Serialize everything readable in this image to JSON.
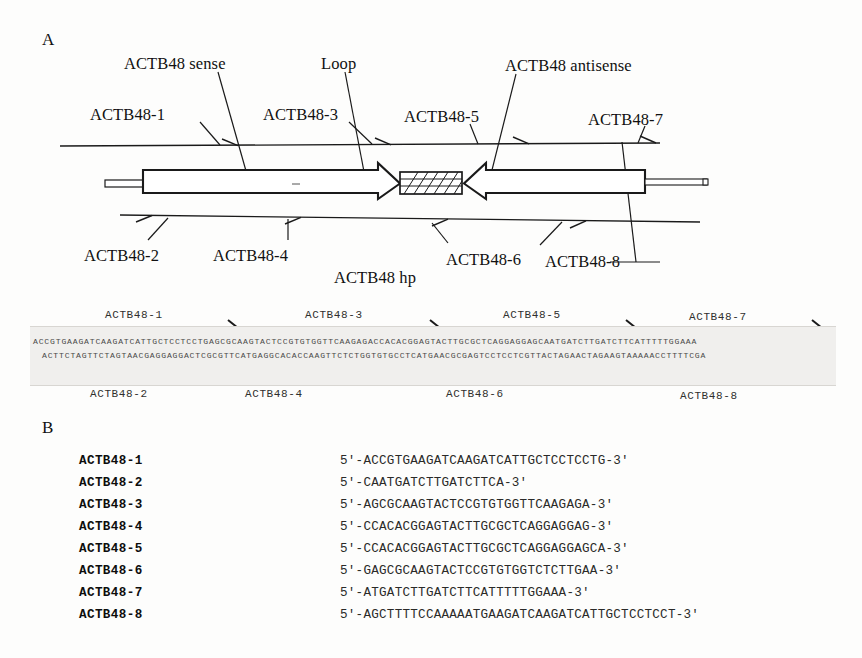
{
  "panels": {
    "a_letter": "A",
    "b_letter": "B"
  },
  "panel_a": {
    "annotations": {
      "sense": "ACTB48 sense",
      "loop": "Loop",
      "antisense": "ACTB48 antisense",
      "hairpin": "ACTB48 hp"
    },
    "top_primers": [
      {
        "label": "ACTB48-1"
      },
      {
        "label": "ACTB48-3"
      },
      {
        "label": "ACTB48-5"
      },
      {
        "label": "ACTB48-7"
      }
    ],
    "bottom_primers": [
      {
        "label": "ACTB48-2"
      },
      {
        "label": "ACTB48-4"
      },
      {
        "label": "ACTB48-6"
      },
      {
        "label": "ACTB48-8"
      }
    ]
  },
  "alignment": {
    "top_strand": "ACCGTGAAGATCAAGATCATTGCTCCTCCTGAGCGCAAGTACTCCGTGTGGTTCAAGAGACCACACGGAGTACTTGCGCTCAGGAGGAGCAATGATCTTGATCTTCATTTTTGGAAA",
    "bottom_strand": "ACTTCTAGTTCTAGTAACGAGGAGGACTCGCGTTCATGAGGCACACCAAGTTCTCTGGTGTGCCTCATGAACGCGAGTCCTCCTCGTTACTAGAACTAGAAGTAAAAACCTTTTCGA",
    "top_primer_labels": [
      "ACTB48-1",
      "ACTB48-3",
      "ACTB48-5",
      "ACTB48-7"
    ],
    "bottom_primer_labels": [
      "ACTB48-2",
      "ACTB48-4",
      "ACTB48-6",
      "ACTB48-8"
    ]
  },
  "panel_b": {
    "rows": [
      {
        "name": "ACTB48-1",
        "sequence": "5′-ACCGTGAAGATCAAGATCATTGCTCCTCCTG-3′"
      },
      {
        "name": "ACTB48-2",
        "sequence": "5′-CAATGATCTTGATCTTCA-3′"
      },
      {
        "name": "ACTB48-3",
        "sequence": "5′-AGCGCAAGTACTCCGTGTGGTTCAAGAGA-3′"
      },
      {
        "name": "ACTB48-4",
        "sequence": "5′-CCACACGGAGTACTTGCGCTCAGGAGGAG-3′"
      },
      {
        "name": "ACTB48-5",
        "sequence": "5′-CCACACGGAGTACTTGCGCTCAGGAGGAGCA-3′"
      },
      {
        "name": "ACTB48-6",
        "sequence": "5′-GAGCGCAAGTACTCCGTGTGGTCTCTTGAA-3′"
      },
      {
        "name": "ACTB48-7",
        "sequence": "5′-ATGATCTTGATCTTCATTTTTGGAAA-3′"
      },
      {
        "name": "ACTB48-8",
        "sequence": "5′-AGCTTTTCCAAAAATGAAGATCAAGATCATTGCTCCTCCT-3′"
      }
    ]
  },
  "colors": {
    "ink": "#111111",
    "seq_block_bg": "#f0efed",
    "seq_text": "#4a4a48"
  }
}
